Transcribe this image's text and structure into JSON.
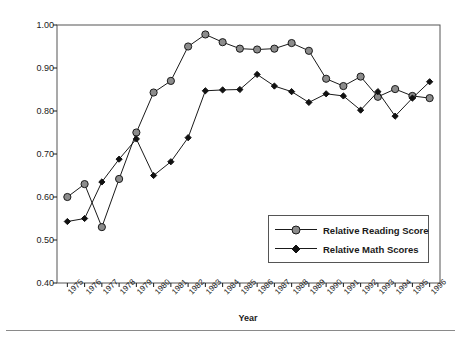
{
  "chart_data": {
    "type": "line",
    "title": "",
    "xlabel": "Year",
    "ylabel": "Performance Relative to NYC",
    "xlim": [
      1974.4,
      1996.6
    ],
    "ylim": [
      0.4,
      1.0
    ],
    "yticks": [
      "0.40",
      "0.50",
      "0.60",
      "0.70",
      "0.80",
      "0.90",
      "1.00"
    ],
    "ytick_values": [
      0.4,
      0.5,
      0.6,
      0.7,
      0.8,
      0.9,
      1.0
    ],
    "grid": false,
    "legend_position": "lower-right",
    "categories": [
      "1975",
      "1976",
      "1977",
      "1978",
      "1979",
      "1980",
      "1981",
      "1982",
      "1983",
      "1984",
      "1985",
      "1986",
      "1987",
      "1988",
      "1989",
      "1990",
      "1991",
      "1992",
      "1993",
      "1994",
      "1995",
      "1996"
    ],
    "x": [
      1975,
      1976,
      1977,
      1978,
      1979,
      1980,
      1981,
      1982,
      1983,
      1984,
      1985,
      1986,
      1987,
      1988,
      1989,
      1990,
      1991,
      1992,
      1993,
      1994,
      1995,
      1996
    ],
    "series": [
      {
        "name": "Relative Reading Score",
        "marker": "circle",
        "marker_fill": "#8c8c8c",
        "marker_edge": "#1a1a1a",
        "line_color": "#1a1a1a",
        "values": [
          0.6,
          0.63,
          0.53,
          0.642,
          0.75,
          0.843,
          0.87,
          0.95,
          0.978,
          0.96,
          0.945,
          0.943,
          0.945,
          0.958,
          0.94,
          0.875,
          0.858,
          0.88,
          0.833,
          0.851,
          0.835,
          0.83
        ]
      },
      {
        "name": "Relative Math Scores",
        "marker": "diamond",
        "marker_fill": "#111111",
        "marker_edge": "#111111",
        "line_color": "#1a1a1a",
        "values": [
          0.543,
          0.55,
          0.635,
          0.688,
          0.735,
          0.65,
          0.682,
          0.738,
          0.847,
          0.849,
          0.85,
          0.885,
          0.858,
          0.845,
          0.82,
          0.84,
          0.835,
          0.802,
          0.845,
          0.788,
          0.83,
          0.868
        ]
      }
    ]
  },
  "legend": {
    "items": [
      {
        "label": "Relative Reading Score"
      },
      {
        "label": "Relative Math Scores"
      }
    ]
  },
  "colors": {
    "axis": "#1a1a1a",
    "frame": "#555555",
    "reading_marker": "#8c8c8c",
    "math_marker": "#111111",
    "rule": "#8a8a8a"
  }
}
